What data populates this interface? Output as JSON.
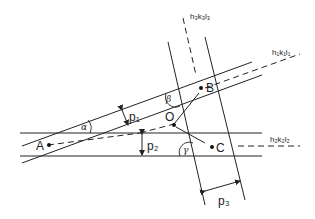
{
  "figure": {
    "planes": {
      "plane1": "h₁k₁l₁",
      "plane2": "h₂k₂l₂",
      "plane3": "h₃k₃l₃"
    },
    "points": {
      "A": "A",
      "B": "B",
      "C": "C",
      "O": "O"
    },
    "angles": {
      "alpha": "α",
      "beta": "β",
      "gamma": "γ"
    },
    "widths": {
      "p1": "p₁",
      "p2": "p₂",
      "p3": "p₃"
    }
  },
  "colors": {
    "line": "#222222",
    "background": "#ffffff"
  }
}
